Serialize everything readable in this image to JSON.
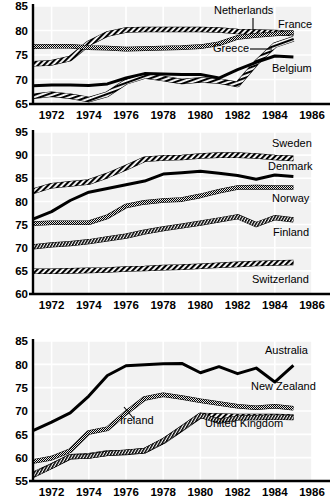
{
  "chart_data": [
    {
      "type": "line",
      "title": "",
      "panel_name": "panel-1",
      "xlabel": "",
      "ylabel": "",
      "grid": true,
      "legend_position": "right-inline",
      "xlim": [
        1971,
        1986
      ],
      "ylim": [
        65,
        85
      ],
      "yticks": [
        65,
        70,
        75,
        80,
        85
      ],
      "xticks": [
        1972,
        1974,
        1976,
        1978,
        1980,
        1982,
        1984,
        1986
      ],
      "xtick_labels": [
        "1972",
        "1974",
        "1976",
        "1978",
        "1980",
        "1982",
        "1984",
        "1986"
      ],
      "ytick_labels": [
        "65",
        "70",
        "75",
        "80",
        "85"
      ],
      "x": [
        1971,
        1972,
        1973,
        1974,
        1975,
        1976,
        1977,
        1978,
        1979,
        1980,
        1981,
        1982,
        1983,
        1984,
        1985
      ],
      "series": [
        {
          "name": "Netherlands",
          "style": "coarse-hatch",
          "values": [
            73.2,
            73.4,
            74.3,
            77.4,
            79.3,
            80.1,
            80.2,
            80.2,
            80.2,
            80.2,
            80.1,
            79.8,
            79.7,
            79.6,
            79.4
          ]
        },
        {
          "name": "France",
          "style": "fine-dot",
          "values": [
            76.7,
            76.8,
            76.8,
            76.5,
            76.4,
            76.2,
            76.3,
            76.4,
            76.5,
            76.7,
            77.3,
            78.6,
            79.0,
            79.3,
            79.6
          ]
        },
        {
          "name": "Greece",
          "style": "coarse-hatch-steep",
          "values": [
            66.6,
            67.0,
            66.6,
            65.9,
            67.0,
            69.5,
            70.7,
            70.2,
            69.6,
            69.9,
            69.7,
            69.0,
            73.4,
            77.0,
            78.3
          ]
        },
        {
          "name": "Belgium",
          "style": "solid",
          "values": [
            68.7,
            68.9,
            68.9,
            68.8,
            69.1,
            70.3,
            71.2,
            71.1,
            71.0,
            71.0,
            70.3,
            72.0,
            73.5,
            74.8,
            74.6
          ]
        }
      ],
      "annotations": [
        {
          "text": "Netherlands",
          "leader": true
        },
        {
          "text": "France",
          "leader": false
        },
        {
          "text": "Greece",
          "leader": true
        },
        {
          "text": "Belgium",
          "leader": false
        }
      ]
    },
    {
      "type": "line",
      "title": "",
      "panel_name": "panel-2",
      "xlabel": "",
      "ylabel": "",
      "grid": true,
      "legend_position": "right-inline",
      "xlim": [
        1971,
        1986
      ],
      "ylim": [
        60,
        95
      ],
      "yticks": [
        60,
        65,
        70,
        75,
        80,
        85,
        90,
        95
      ],
      "xticks": [
        1972,
        1974,
        1976,
        1978,
        1980,
        1982,
        1984,
        1986
      ],
      "xtick_labels": [
        "1972",
        "1974",
        "1976",
        "1978",
        "1980",
        "1982",
        "1984",
        "1986"
      ],
      "ytick_labels": [
        "60",
        "65",
        "70",
        "75",
        "80",
        "85",
        "90",
        "95"
      ],
      "x": [
        1971,
        1972,
        1973,
        1974,
        1975,
        1976,
        1977,
        1978,
        1979,
        1980,
        1981,
        1982,
        1983,
        1984,
        1985
      ],
      "series": [
        {
          "name": "Sweden",
          "style": "coarse-hatch",
          "values": [
            82.2,
            83.4,
            83.8,
            84.2,
            85.6,
            87.3,
            89.1,
            89.4,
            89.5,
            89.8,
            90.0,
            90.0,
            89.8,
            89.5,
            89.3
          ]
        },
        {
          "name": "Denmark",
          "style": "solid",
          "values": [
            76.2,
            77.8,
            80.2,
            82.0,
            82.8,
            83.6,
            84.4,
            85.9,
            86.2,
            86.5,
            86.1,
            85.6,
            84.8,
            85.7,
            85.4
          ]
        },
        {
          "name": "Norway",
          "style": "fine-dot",
          "values": [
            75.2,
            75.4,
            75.4,
            75.4,
            76.7,
            79.0,
            79.8,
            80.2,
            80.4,
            81.2,
            82.2,
            83.0,
            83.1,
            83.0,
            83.0
          ]
        },
        {
          "name": "Finland",
          "style": "fine-dot-thick",
          "values": [
            70.2,
            70.6,
            70.9,
            71.3,
            71.9,
            72.5,
            73.4,
            74.1,
            74.7,
            75.3,
            76.0,
            76.7,
            75.0,
            76.5,
            76.0
          ]
        },
        {
          "name": "Switzerland",
          "style": "coarse-hatch",
          "values": [
            64.9,
            64.9,
            65.0,
            65.1,
            65.2,
            65.4,
            65.5,
            65.7,
            65.8,
            66.0,
            66.2,
            66.4,
            66.6,
            66.7,
            66.8
          ]
        }
      ],
      "annotations": [
        {
          "text": "Sweden",
          "leader": false
        },
        {
          "text": "Denmark",
          "leader": false
        },
        {
          "text": "Norway",
          "leader": false
        },
        {
          "text": "Finland",
          "leader": false
        },
        {
          "text": "Switzerland",
          "leader": false
        }
      ]
    },
    {
      "type": "line",
      "title": "",
      "panel_name": "panel-3",
      "xlabel": "",
      "ylabel": "",
      "grid": true,
      "legend_position": "right-inline",
      "xlim": [
        1971,
        1986
      ],
      "ylim": [
        55,
        85
      ],
      "yticks": [
        55,
        60,
        65,
        70,
        75,
        80,
        85
      ],
      "xticks": [
        1972,
        1974,
        1976,
        1978,
        1980,
        1982,
        1984,
        1986
      ],
      "xtick_labels": [
        "1972",
        "1974",
        "1976",
        "1978",
        "1980",
        "1982",
        "1984",
        "1986"
      ],
      "ytick_labels": [
        "55",
        "60",
        "65",
        "70",
        "75",
        "80",
        "85"
      ],
      "x": [
        1971,
        1972,
        1973,
        1974,
        1975,
        1976,
        1977,
        1978,
        1979,
        1980,
        1981,
        1982,
        1983,
        1984,
        1985
      ],
      "series": [
        {
          "name": "Australia",
          "style": "solid",
          "values": [
            65.8,
            67.6,
            69.6,
            73.2,
            77.6,
            79.7,
            79.9,
            80.1,
            80.2,
            78.2,
            79.5,
            78.0,
            79.2,
            76.2,
            79.8
          ]
        },
        {
          "name": "New Zealand",
          "style": "fine-dot",
          "values": [
            59.2,
            59.9,
            61.5,
            65.4,
            66.2,
            69.6,
            72.7,
            73.5,
            72.9,
            72.2,
            71.6,
            71.0,
            70.7,
            71.0,
            70.6
          ]
        },
        {
          "name": "Ireland",
          "style": "coarse-hatch",
          "values": [
            56.4,
            58.2,
            60.2,
            60.4,
            61.0,
            61.1,
            61.5,
            63.5,
            66.2,
            69.0,
            68.9,
            68.8,
            68.8,
            68.8,
            68.7
          ]
        },
        {
          "name": "United Kingdom",
          "style": "fine-dot-thick",
          "values": [
            56.2,
            58.2,
            60.2,
            60.3,
            60.9,
            61.2,
            61.5,
            63.6,
            66.3,
            69.1,
            67.8,
            68.5,
            68.6,
            68.7,
            68.6
          ]
        }
      ],
      "annotations": [
        {
          "text": "Australia",
          "leader": false
        },
        {
          "text": "New Zealand",
          "leader": false
        },
        {
          "text": "Ireland",
          "leader": true
        },
        {
          "text": "United Kingdom",
          "leader": false
        }
      ]
    }
  ],
  "labels": {
    "panel1": {
      "netherlands": "Netherlands",
      "france": "France",
      "greece": "Greece",
      "belgium": "Belgium"
    },
    "panel2": {
      "sweden": "Sweden",
      "denmark": "Denmark",
      "norway": "Norway",
      "finland": "Finland",
      "switzerland": "Switzerland"
    },
    "panel3": {
      "australia": "Australia",
      "new_zealand": "New Zealand",
      "ireland": "Ireland",
      "united_kingdom": "United Kingdom"
    }
  },
  "colors": {
    "ink": "#000000",
    "panel_background": "#f2f2f2",
    "gridline": "#ffffff",
    "page_background": "#ffffff"
  }
}
